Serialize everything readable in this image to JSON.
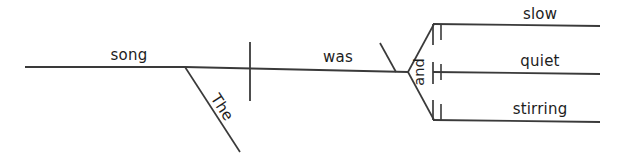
{
  "diagram": {
    "type": "reed-kellogg-sentence-diagram",
    "sentence": "The song was slow, quiet and stirring.",
    "colors": {
      "background": "#ffffff",
      "line": "#3a3a3a",
      "text": "#1d1d1d"
    },
    "words": {
      "subject": "song",
      "article": "The",
      "verb": "was",
      "conjunction": "and",
      "complement_1": "slow",
      "complement_2": "quiet",
      "complement_3": "stirring"
    },
    "labels": {
      "subject_label": "song",
      "article_label": "The",
      "verb_label": "was",
      "conjunction_label": "and",
      "complements": [
        "slow",
        "quiet",
        "stirring"
      ]
    }
  }
}
